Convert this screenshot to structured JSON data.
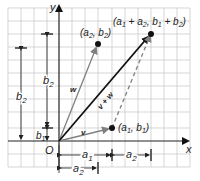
{
  "diagram": {
    "axes": {
      "x_label": "x",
      "y_label": "y",
      "origin_label": "O"
    },
    "points": [
      {
        "id": "p1",
        "label_a": "a",
        "label_a_sub": "1",
        "label_b": "b",
        "label_b_sub": "1",
        "text": "(a1, b1)"
      },
      {
        "id": "p2",
        "label_a": "a",
        "label_a_sub": "2",
        "label_b": "b",
        "label_b_sub": "2",
        "text": "(a2, b2)"
      },
      {
        "id": "sum",
        "text": "(a1 + a2, b1 + b2)"
      }
    ],
    "vectors": [
      {
        "id": "v",
        "label": "v",
        "color": "#777777"
      },
      {
        "id": "w",
        "label": "w",
        "color": "#777777"
      },
      {
        "id": "vw",
        "label": "v + w",
        "color": "#111111"
      }
    ],
    "dimensions": {
      "left_b2": "b",
      "left_b2_sub": "2",
      "mid_b2": "b",
      "mid_b2_sub": "2",
      "b1": "b",
      "b1_sub": "1",
      "a1": "a",
      "a1_sub": "1",
      "a2_right": "a",
      "a2_right_sub": "2",
      "a2_bottom": "a",
      "a2_bottom_sub": "2"
    },
    "colors": {
      "grid": "#bdbdbd",
      "axis": "#222222",
      "gray_vector": "#808080",
      "sum_vector": "#111111"
    }
  }
}
